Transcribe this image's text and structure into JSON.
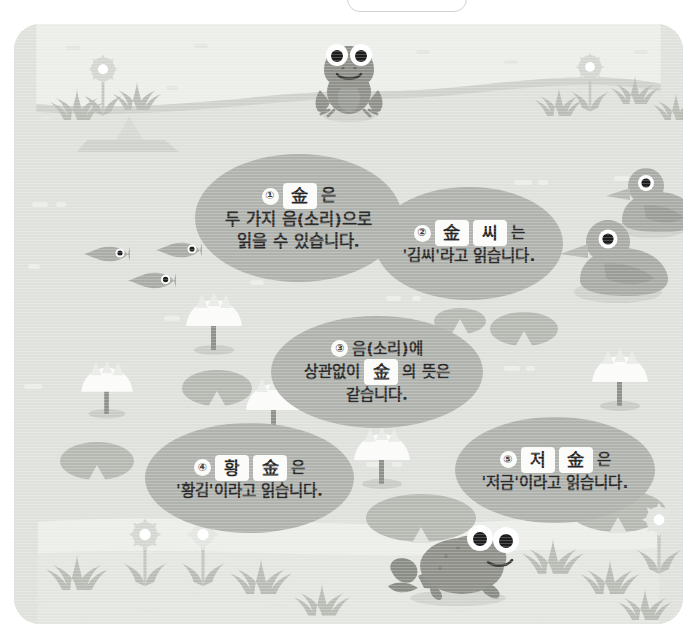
{
  "page": {
    "top_tab_label": ""
  },
  "colors": {
    "water": "#dfe1dd",
    "grass": "#eceeea",
    "bubble": "#b0b2ad",
    "lilypad": "#b6b8b2",
    "plant": "#b9bbb5",
    "chip_bg": "#fbfbfa",
    "text": "#2b2b2b",
    "frame_border": "#d2d2d2"
  },
  "bubbles": [
    {
      "id": 1,
      "number": "①",
      "lines": [
        {
          "parts": [
            {
              "type": "num",
              "text": "①"
            },
            {
              "type": "chip",
              "text": "金"
            },
            {
              "type": "text",
              "text": "은"
            }
          ]
        },
        {
          "parts": [
            {
              "type": "text",
              "text": "두 가지 음(소리)으로"
            }
          ]
        },
        {
          "parts": [
            {
              "type": "text",
              "text": "읽을 수 있습니다."
            }
          ]
        }
      ]
    },
    {
      "id": 2,
      "number": "②",
      "lines": [
        {
          "parts": [
            {
              "type": "num",
              "text": "②"
            },
            {
              "type": "chip",
              "text": "金"
            },
            {
              "type": "chip",
              "text": "씨"
            },
            {
              "type": "text",
              "text": "는"
            }
          ]
        },
        {
          "parts": [
            {
              "type": "text",
              "text": "'김씨'라고 읽습니다."
            }
          ]
        }
      ]
    },
    {
      "id": 3,
      "number": "③",
      "lines": [
        {
          "parts": [
            {
              "type": "num",
              "text": "③"
            },
            {
              "type": "text",
              "text": "음(소리)에"
            }
          ]
        },
        {
          "parts": [
            {
              "type": "text",
              "text": "상관없이"
            },
            {
              "type": "chip",
              "text": "金"
            },
            {
              "type": "text",
              "text": "의 뜻은"
            }
          ]
        },
        {
          "parts": [
            {
              "type": "text",
              "text": "같습니다."
            }
          ]
        }
      ]
    },
    {
      "id": 4,
      "number": "④",
      "lines": [
        {
          "parts": [
            {
              "type": "num",
              "text": "④"
            },
            {
              "type": "chip",
              "text": "황"
            },
            {
              "type": "chip",
              "text": "金"
            },
            {
              "type": "text",
              "text": "은"
            }
          ]
        },
        {
          "parts": [
            {
              "type": "text",
              "text": "'황김'이라고 읽습니다."
            }
          ]
        }
      ]
    },
    {
      "id": 5,
      "number": "⑤",
      "lines": [
        {
          "parts": [
            {
              "type": "num",
              "text": "⑤"
            },
            {
              "type": "chip",
              "text": "저"
            },
            {
              "type": "chip",
              "text": "金"
            },
            {
              "type": "text",
              "text": "은"
            }
          ]
        },
        {
          "parts": [
            {
              "type": "text",
              "text": "'저금'이라고 읽습니다."
            }
          ]
        }
      ]
    }
  ],
  "illustration": {
    "animals": [
      {
        "name": "frog-top",
        "label": "개구리"
      },
      {
        "name": "frog-bottom",
        "label": "개구리"
      },
      {
        "name": "duck-back",
        "label": "오리"
      },
      {
        "name": "duck-front",
        "label": "오리"
      },
      {
        "name": "fish-1",
        "label": "물고기"
      },
      {
        "name": "fish-2",
        "label": "물고기"
      },
      {
        "name": "fish-3",
        "label": "물고기"
      }
    ],
    "plants": [
      {
        "name": "lotus-flower",
        "count": 5
      },
      {
        "name": "lily-pad",
        "count": 6
      },
      {
        "name": "grass-tuft",
        "count": 14
      },
      {
        "name": "daisy-flower",
        "count": 5
      }
    ],
    "scenery": [
      {
        "name": "rock",
        "label": "바위"
      }
    ]
  }
}
